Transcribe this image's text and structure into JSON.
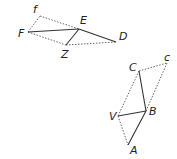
{
  "figures": [
    {
      "name": "upper-figure",
      "points": {
        "f": {
          "x": 40,
          "y": 16,
          "label": "f",
          "lx": 33,
          "ly": 13
        },
        "F": {
          "x": 28,
          "y": 32,
          "label": "F",
          "lx": 18,
          "ly": 37
        },
        "E": {
          "x": 79,
          "y": 29,
          "label": "E",
          "lx": 80,
          "ly": 24
        },
        "Z": {
          "x": 66,
          "y": 45,
          "label": "Z",
          "lx": 61,
          "ly": 58
        },
        "D": {
          "x": 116,
          "y": 42,
          "label": "D",
          "lx": 119,
          "ly": 40
        }
      }
    },
    {
      "name": "lower-figure",
      "points": {
        "C": {
          "x": 139,
          "y": 71,
          "label": "C",
          "lx": 129,
          "ly": 71
        },
        "c": {
          "x": 167,
          "y": 63,
          "label": "c",
          "lx": 164,
          "ly": 61
        },
        "B": {
          "x": 146,
          "y": 111,
          "label": "B",
          "lx": 149,
          "ly": 115
        },
        "V": {
          "x": 118,
          "y": 116,
          "label": "V",
          "lx": 109,
          "ly": 120
        },
        "A": {
          "x": 128,
          "y": 145,
          "label": "A",
          "lx": 130,
          "ly": 154
        }
      }
    }
  ]
}
